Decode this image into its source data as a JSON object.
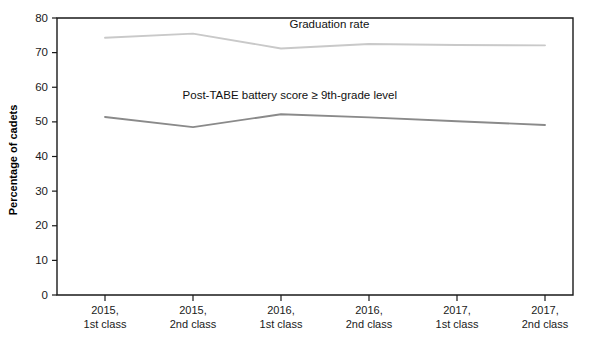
{
  "chart_data": {
    "type": "line",
    "title": "",
    "xlabel": "",
    "ylabel": "Percentage of cadets",
    "ylim": [
      0,
      80
    ],
    "yticks": [
      0,
      10,
      20,
      30,
      40,
      50,
      60,
      70,
      80
    ],
    "ytick_labels": [
      "0",
      "10",
      "20",
      "30",
      "40",
      "50",
      "60",
      "70",
      "80"
    ],
    "grid": false,
    "legend_position": "inline-annotation",
    "categories": [
      "2015,\n1st class",
      "2015,\n2nd class",
      "2016,\n1st class",
      "2016,\n2nd class",
      "2017,\n1st class",
      "2017,\n2nd class"
    ],
    "category_lines": [
      [
        "2015,",
        "1st class"
      ],
      [
        "2015,",
        "2nd class"
      ],
      [
        "2016,",
        "1st class"
      ],
      [
        "2016,",
        "2nd class"
      ],
      [
        "2017,",
        "1st class"
      ],
      [
        "2017,",
        "2nd class"
      ]
    ],
    "series": [
      {
        "name": "Graduation rate",
        "color": "#c9c9c9",
        "values": [
          74.3,
          75.5,
          71.2,
          72.5,
          72.2,
          72.1
        ]
      },
      {
        "name": "Post-TABE battery score ≥ 9th-grade level",
        "color": "#8a8a8a",
        "values": [
          51.4,
          48.5,
          52.2,
          51.3,
          50.2,
          49.1
        ]
      }
    ],
    "annotations": [
      {
        "text": "Graduation rate",
        "x_index": 2.55,
        "y": 77.0
      },
      {
        "text": "Post-TABE battery score ≥ 9th-grade level",
        "x_index": 2.1,
        "y": 56.5
      }
    ]
  },
  "colors": {
    "axis": "#1a1a1a",
    "background": "#ffffff",
    "graduation_rate": "#c9c9c9",
    "post_tabe": "#8a8a8a"
  }
}
